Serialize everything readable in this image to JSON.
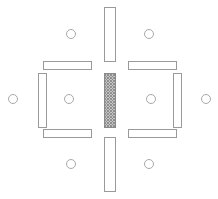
{
  "diagram": {
    "type": "technical-schematic",
    "canvas": {
      "width": 218,
      "height": 199,
      "background": "#ffffff"
    },
    "colors": {
      "outline": "#9a9a9a",
      "circle_outline": "#a8a8a8",
      "fill": "#ffffff",
      "hatch": "#8a8a8a"
    },
    "bars": [
      {
        "name": "top-center-bar",
        "orientation": "vertical",
        "fill_style": "solid",
        "x": 104.5,
        "y": 7.5,
        "width": 11,
        "height": 54
      },
      {
        "name": "bottom-center-bar",
        "orientation": "vertical",
        "fill_style": "solid",
        "x": 104.5,
        "y": 137.5,
        "width": 11,
        "height": 54
      },
      {
        "name": "center-hatched-bar",
        "orientation": "vertical",
        "fill_style": "crosshatch",
        "x": 104.5,
        "y": 73.5,
        "width": 11,
        "height": 54
      },
      {
        "name": "upper-left-horizontal-bar",
        "orientation": "horizontal",
        "fill_style": "solid",
        "x": 43.5,
        "y": 61.5,
        "width": 48,
        "height": 8
      },
      {
        "name": "lower-left-horizontal-bar",
        "orientation": "horizontal",
        "fill_style": "solid",
        "x": 43.5,
        "y": 129.5,
        "width": 48,
        "height": 8
      },
      {
        "name": "upper-right-horizontal-bar",
        "orientation": "horizontal",
        "fill_style": "solid",
        "x": 128.5,
        "y": 61.5,
        "width": 48,
        "height": 8
      },
      {
        "name": "lower-right-horizontal-bar",
        "orientation": "horizontal",
        "fill_style": "solid",
        "x": 128.5,
        "y": 129.5,
        "width": 48,
        "height": 8
      },
      {
        "name": "left-inner-vertical-bar",
        "orientation": "vertical",
        "fill_style": "solid",
        "x": 38.5,
        "y": 73.5,
        "width": 8,
        "height": 54
      },
      {
        "name": "right-inner-vertical-bar",
        "orientation": "vertical",
        "fill_style": "solid",
        "x": 173.5,
        "y": 73.5,
        "width": 8,
        "height": 54
      }
    ],
    "circles": [
      {
        "name": "node-top-left",
        "cx": 71,
        "cy": 34,
        "r": 4.5
      },
      {
        "name": "node-top-right",
        "cx": 149,
        "cy": 34,
        "r": 4.5
      },
      {
        "name": "node-left-outer",
        "cx": 13,
        "cy": 99,
        "r": 4.5
      },
      {
        "name": "node-left-inner",
        "cx": 69,
        "cy": 99,
        "r": 4.5
      },
      {
        "name": "node-right-inner",
        "cx": 151,
        "cy": 99,
        "r": 4.5
      },
      {
        "name": "node-right-outer",
        "cx": 206,
        "cy": 99,
        "r": 4.5
      },
      {
        "name": "node-bottom-left",
        "cx": 71,
        "cy": 164,
        "r": 4.5
      },
      {
        "name": "node-bottom-right",
        "cx": 149,
        "cy": 164,
        "r": 4.5
      }
    ]
  }
}
